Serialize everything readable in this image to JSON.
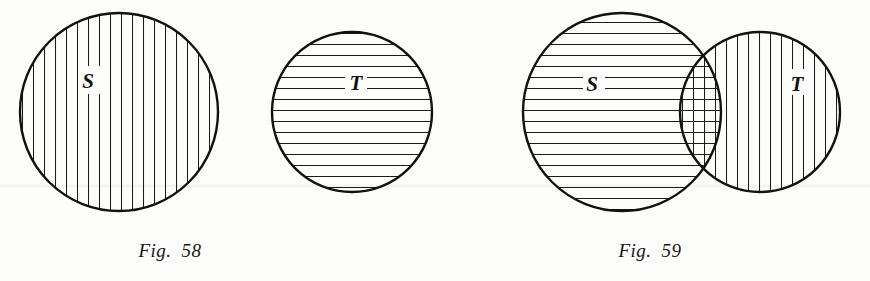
{
  "page": {
    "background_color": "#fdfdfc",
    "ink_color": "#111111",
    "width": 870,
    "height": 281
  },
  "figures": [
    {
      "id": "fig-58",
      "caption": "Fig.  58",
      "description": "Two disjoint circles representing sets S and T with no common region",
      "shapes": [
        {
          "name": "set-s-circle",
          "label": "S",
          "cx": 119,
          "cy": 112,
          "r": 99,
          "hatch": "vertical",
          "label_x": 88,
          "label_y": 83
        },
        {
          "name": "set-t-circle",
          "label": "T",
          "cx": 352,
          "cy": 112,
          "r": 80,
          "hatch": "horizontal",
          "label_x": 355,
          "label_y": 85
        }
      ]
    },
    {
      "id": "fig-59",
      "caption": "Fig.  59",
      "description": "Two overlapping circles representing sets S and T sharing a lens-shaped intersection",
      "shapes": [
        {
          "name": "set-s-circle",
          "label": "S",
          "cx": 622,
          "cy": 112,
          "r": 99,
          "hatch": "horizontal",
          "label_x": 592,
          "label_y": 86
        },
        {
          "name": "set-t-circle",
          "label": "T",
          "cx": 760,
          "cy": 112,
          "r": 80,
          "hatch": "vertical",
          "label_x": 795,
          "label_y": 86
        }
      ]
    }
  ],
  "hatching": {
    "vertical_spacing_px": 11,
    "horizontal_spacing_px": 11,
    "line_width_px": 1,
    "outline_width_px": 2.4
  },
  "artifact": {
    "name": "scan-line",
    "y": 186,
    "color": "#f2f2f0"
  }
}
